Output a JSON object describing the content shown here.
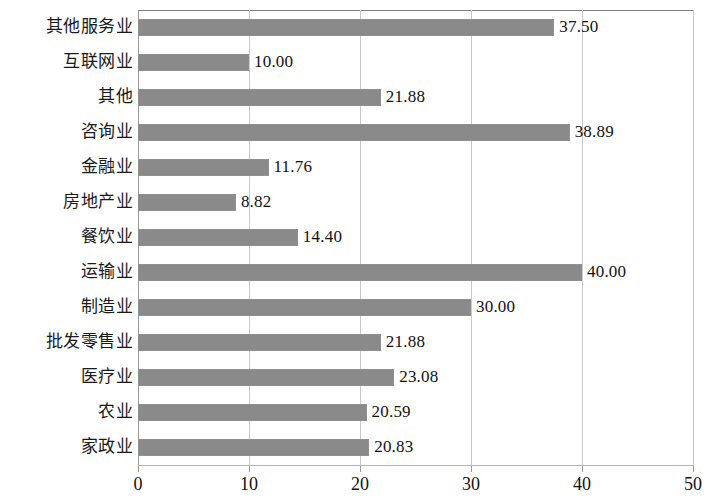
{
  "chart_data": {
    "type": "bar",
    "orientation": "horizontal",
    "title": "",
    "xlabel": "",
    "ylabel": "",
    "xlim": [
      0,
      50
    ],
    "xticks": [
      "0",
      "10",
      "20",
      "30",
      "40",
      "50"
    ],
    "grid": "vertical",
    "legend": "none",
    "bar_color": "#8a8a8a",
    "categories": [
      "其他服务业",
      "互联网业",
      "其他",
      "咨询业",
      "金融业",
      "房地产业",
      "餐饮业",
      "运输业",
      "制造业",
      "批发零售业",
      "医疗业",
      "农业",
      "家政业"
    ],
    "values": [
      37.5,
      10.0,
      21.88,
      38.89,
      11.76,
      8.82,
      14.4,
      40.0,
      30.0,
      21.88,
      23.08,
      20.59,
      20.83
    ],
    "value_labels": [
      "37.50",
      "10.00",
      "21.88",
      "38.89",
      "11.76",
      "8.82",
      "14.40",
      "40.00",
      "30.00",
      "21.88",
      "23.08",
      "20.59",
      "20.83"
    ]
  }
}
